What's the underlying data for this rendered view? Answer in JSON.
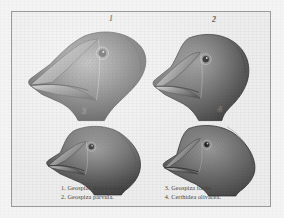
{
  "plate": {
    "title": "Darwin's Finches — beak variation plate",
    "background_color": "#ededed",
    "frame_color": "#9a9a9a",
    "ink_color": "#4a4a4a",
    "figure_numbers": [
      "1",
      "2",
      "3",
      "4"
    ]
  },
  "figures": [
    {
      "number": "1",
      "species": "Geospiza magnirostris",
      "beak": "very large, deep, massive conical beak",
      "position": "top-left"
    },
    {
      "number": "2",
      "species": "Geospiza parvula",
      "beak": "smaller stout conical beak",
      "position": "top-right"
    },
    {
      "number": "3",
      "species": "Geospiza fortis",
      "beak": "medium conical beak",
      "position": "bottom-left"
    },
    {
      "number": "4",
      "species": "Certhidea olivacea",
      "beak": "slender pointed warbler-like beak",
      "position": "bottom-right"
    }
  ],
  "caption": {
    "left_column": [
      {
        "index": "1.",
        "name": "Geospiza magnirostris."
      },
      {
        "index": "2.",
        "name": "Geospiza parvula."
      }
    ],
    "right_column": [
      {
        "index": "3.",
        "name": "Geospiza fortis."
      },
      {
        "index": "4.",
        "name": "Certhidea olivacea."
      }
    ]
  }
}
